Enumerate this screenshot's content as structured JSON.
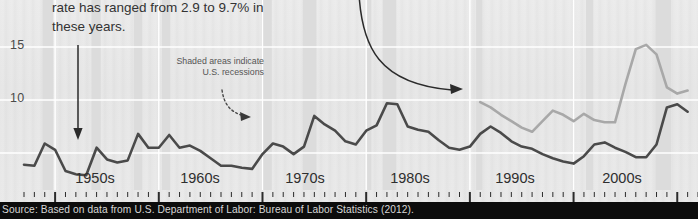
{
  "figure": {
    "callout_top": "rate has ranged from 2.9 to 9.7% in these years.",
    "callout_shaded": "Shaded areas indicate U.S. recessions",
    "source": "Source: Based on data from U.S. Department of Labor: Bureau of Labor Statistics (2012).",
    "colors": {
      "background": "#e9e9e9",
      "gridline": "#ffffff",
      "series_primary": "#4a4a4a",
      "series_secondary": "#a8a8a8",
      "recession_band": "#dcdcdc",
      "source_bar": "#0c0c0c",
      "source_text": "#d8d8d8",
      "annotation": "#2b2b2b"
    }
  },
  "chart_data": {
    "type": "line",
    "title": "",
    "xlabel": "",
    "ylabel": "",
    "ylim": [
      0,
      17
    ],
    "yticks": [
      10,
      15
    ],
    "ytick_labels": [
      "10",
      "15"
    ],
    "grid": true,
    "xlim": [
      1947,
      2012
    ],
    "xtick_labels": [
      "1950s",
      "1960s",
      "1970s",
      "1980s",
      "1990s",
      "2000s"
    ],
    "xtick_positions": [
      1955,
      1965,
      1975,
      1985,
      1995,
      2005
    ],
    "legend": "none",
    "annotations": [
      {
        "text": "rate has ranged from 2.9 to 9.7% in these years.",
        "kind": "callout",
        "arrow": "straight-down",
        "points_to_year": 1954
      },
      {
        "text": "Shaded areas indicate U.S. recessions",
        "kind": "callout",
        "arrow": "dotted-curve",
        "points_to_year": 1970
      },
      {
        "text": "",
        "kind": "curved-arrow",
        "points_to_year": 1993
      }
    ],
    "series": [
      {
        "name": "Unemployment rate (all workers)",
        "color": "#4a4a4a",
        "x": [
          1947,
          1948,
          1949,
          1950,
          1951,
          1952,
          1953,
          1954,
          1955,
          1956,
          1957,
          1958,
          1959,
          1960,
          1961,
          1962,
          1963,
          1964,
          1965,
          1966,
          1967,
          1968,
          1969,
          1970,
          1971,
          1972,
          1973,
          1974,
          1975,
          1976,
          1977,
          1978,
          1979,
          1980,
          1981,
          1982,
          1983,
          1984,
          1985,
          1986,
          1987,
          1988,
          1989,
          1990,
          1991,
          1992,
          1993,
          1994,
          1995,
          1996,
          1997,
          1998,
          1999,
          2000,
          2001,
          2002,
          2003,
          2004,
          2005,
          2006,
          2007,
          2008,
          2009,
          2010,
          2011
        ],
        "values": [
          3.9,
          3.8,
          5.9,
          5.3,
          3.3,
          3.0,
          2.9,
          5.5,
          4.4,
          4.1,
          4.3,
          6.8,
          5.5,
          5.5,
          6.7,
          5.5,
          5.7,
          5.2,
          4.5,
          3.8,
          3.8,
          3.6,
          3.5,
          4.9,
          5.9,
          5.6,
          4.9,
          5.6,
          8.5,
          7.7,
          7.1,
          6.1,
          5.8,
          7.1,
          7.6,
          9.7,
          9.6,
          7.5,
          7.2,
          7.0,
          6.2,
          5.5,
          5.3,
          5.6,
          6.8,
          7.5,
          6.9,
          6.1,
          5.6,
          5.4,
          4.9,
          4.5,
          4.2,
          4.0,
          4.7,
          5.8,
          6.0,
          5.5,
          5.1,
          4.6,
          4.6,
          5.8,
          9.3,
          9.6,
          8.9
        ]
      },
      {
        "name": "Unemployment rate (secondary series)",
        "color": "#a8a8a8",
        "x": [
          1991,
          1992,
          1993,
          1994,
          1995,
          1996,
          1997,
          1998,
          1999,
          2000,
          2001,
          2002,
          2003,
          2004,
          2005,
          2006,
          2007,
          2008,
          2009,
          2010,
          2011
        ],
        "values": [
          9.8,
          9.3,
          8.6,
          8.0,
          7.4,
          7.0,
          8.0,
          9.0,
          8.6,
          8.0,
          8.7,
          8.1,
          7.9,
          7.9,
          11.5,
          14.8,
          15.2,
          14.3,
          11.2,
          10.6,
          10.9
        ]
      }
    ],
    "recession_bands": [
      {
        "start": 1948.8,
        "end": 1949.8
      },
      {
        "start": 1953.5,
        "end": 1954.4
      },
      {
        "start": 1957.6,
        "end": 1958.4
      },
      {
        "start": 1960.3,
        "end": 1961.1
      },
      {
        "start": 1969.9,
        "end": 1970.9
      },
      {
        "start": 1973.9,
        "end": 1975.2
      },
      {
        "start": 1980.1,
        "end": 1980.5
      },
      {
        "start": 1981.6,
        "end": 1982.9
      },
      {
        "start": 1990.6,
        "end": 1991.2
      },
      {
        "start": 2001.2,
        "end": 2001.9
      },
      {
        "start": 2007.9,
        "end": 2009.4
      }
    ]
  }
}
